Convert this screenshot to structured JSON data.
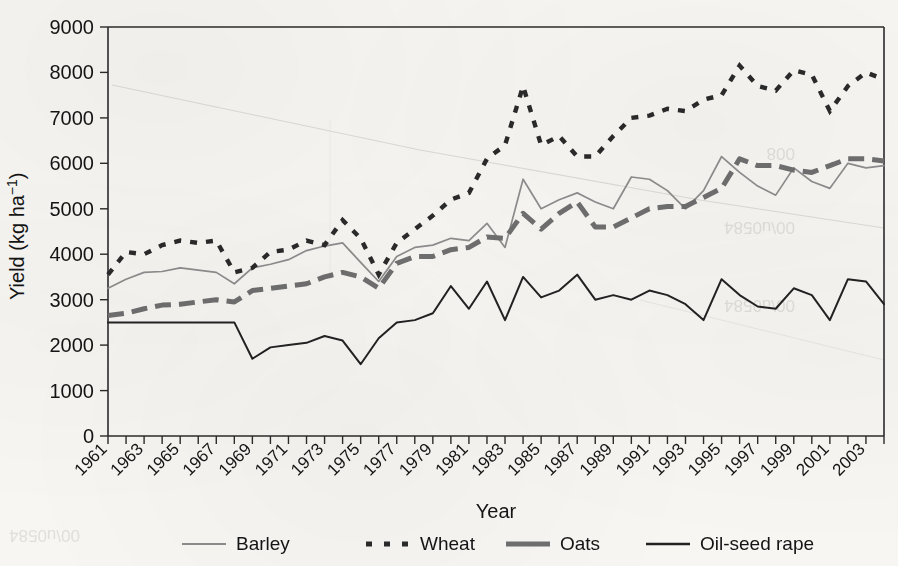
{
  "figure": {
    "background_color": "#f7f6f3",
    "ink_color": "#1a1a1a"
  },
  "axis": {
    "x_title": "Year",
    "y_title": "Yield (kg ha",
    "y_title_exponent": "−1",
    "y_title_close": ")"
  },
  "legend": {
    "position": "bottom",
    "entries": [
      {
        "label": "Barley",
        "style": "thin-solid-gray",
        "color": "#8d8d8d"
      },
      {
        "label": "Wheat",
        "style": "short-dash-black",
        "color": "#2a2a2a"
      },
      {
        "label": "Oats",
        "style": "thick-dash-gray",
        "color": "#6f6f6f"
      },
      {
        "label": "Oil-seed rape",
        "style": "solid-black",
        "color": "#222222"
      }
    ]
  },
  "chart_data": {
    "type": "line",
    "title": "",
    "xlabel": "Year",
    "ylabel": "Yield (kg ha−1)",
    "xlim": [
      1961,
      2004
    ],
    "ylim": [
      0,
      9000
    ],
    "ytick_step": 1000,
    "grid": false,
    "legend_position": "bottom",
    "ytick_labels": [
      "0",
      "1000",
      "2000",
      "3000",
      "4000",
      "5000",
      "6000",
      "7000",
      "8000",
      "9000"
    ],
    "xtick_labels": [
      "1961",
      "1963",
      "1965",
      "1967",
      "1969",
      "1971",
      "1973",
      "1975",
      "1977",
      "1979",
      "1981",
      "1983",
      "1985",
      "1987",
      "1989",
      "1991",
      "1993",
      "1995",
      "1997",
      "1999",
      "2001",
      "2003"
    ],
    "x": [
      1961,
      1962,
      1963,
      1964,
      1965,
      1966,
      1967,
      1968,
      1969,
      1970,
      1971,
      1972,
      1973,
      1974,
      1975,
      1976,
      1977,
      1978,
      1979,
      1980,
      1981,
      1982,
      1983,
      1984,
      1985,
      1986,
      1987,
      1988,
      1989,
      1990,
      1991,
      1992,
      1993,
      1994,
      1995,
      1996,
      1997,
      1998,
      1999,
      2000,
      2001,
      2002,
      2003,
      2004
    ],
    "series": [
      {
        "name": "Barley",
        "color": "#8d8d8d",
        "values": [
          3250,
          3450,
          3600,
          3620,
          3700,
          3650,
          3600,
          3350,
          3700,
          3780,
          3880,
          4080,
          4180,
          4250,
          3820,
          3400,
          3950,
          4150,
          4200,
          4350,
          4300,
          4680,
          4150,
          5650,
          5000,
          5200,
          5350,
          5150,
          5000,
          5700,
          5650,
          5400,
          5000,
          5400,
          6150,
          5800,
          5500,
          5300,
          5900,
          5600,
          5450,
          6000,
          5900,
          5950
        ]
      },
      {
        "name": "Wheat",
        "color": "#2a2a2a",
        "values": [
          3550,
          4050,
          4000,
          4200,
          4300,
          4250,
          4300,
          3600,
          3700,
          4050,
          4100,
          4300,
          4200,
          4750,
          4350,
          3550,
          4250,
          4550,
          4850,
          5200,
          5350,
          6100,
          6400,
          7700,
          6400,
          6600,
          6150,
          6150,
          6600,
          7000,
          7050,
          7200,
          7150,
          7400,
          7500,
          8150,
          7700,
          7600,
          8050,
          7950,
          7150,
          7700,
          8000,
          7850
        ]
      },
      {
        "name": "Oats",
        "color": "#6f6f6f",
        "values": [
          2650,
          2700,
          2800,
          2880,
          2900,
          2950,
          3000,
          2950,
          3200,
          3250,
          3300,
          3350,
          3500,
          3600,
          3500,
          3250,
          3800,
          3950,
          3950,
          4100,
          4150,
          4380,
          4350,
          4900,
          4550,
          4900,
          5150,
          4600,
          4600,
          4800,
          5000,
          5050,
          5050,
          5250,
          5450,
          6100,
          5950,
          5950,
          5850,
          5800,
          5950,
          6100,
          6100,
          6050
        ]
      },
      {
        "name": "Oil-seed rape",
        "color": "#222222",
        "values": [
          2500,
          2500,
          2500,
          2500,
          2500,
          2500,
          2500,
          2500,
          1700,
          1950,
          2000,
          2050,
          2200,
          2100,
          1580,
          2150,
          2500,
          2550,
          2700,
          3300,
          2800,
          3400,
          2550,
          3500,
          3050,
          3200,
          3550,
          3000,
          3100,
          3000,
          3200,
          3100,
          2900,
          2550,
          3450,
          3100,
          2850,
          2800,
          3250,
          3100,
          2550,
          3450,
          3400,
          2900
        ]
      }
    ]
  }
}
